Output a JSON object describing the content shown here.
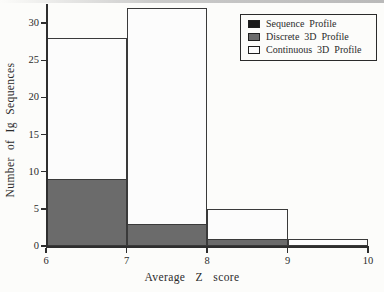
{
  "chart_data": {
    "type": "bar",
    "subtype": "overlaid-histogram",
    "title": "",
    "xlabel": "Average Z score",
    "ylabel": "Number of Ig Sequences",
    "bins": [
      "6-7",
      "7-8",
      "8-9",
      "9-10"
    ],
    "bin_edges": [
      6,
      7,
      8,
      9,
      10
    ],
    "series": [
      {
        "name": "Sequence Profile",
        "color": "#1a1a1a",
        "fill": "black",
        "values": [
          0,
          0,
          0,
          0
        ]
      },
      {
        "name": "Discrete 3D Profile",
        "color": "#6b6b6b",
        "fill": "gray",
        "values": [
          9,
          3,
          1,
          0
        ]
      },
      {
        "name": "Continuous 3D Profile",
        "color": "#fcfcfc",
        "fill": "white",
        "values": [
          28,
          32,
          5,
          1
        ]
      }
    ],
    "x_ticks": [
      6,
      7,
      8,
      9,
      10
    ],
    "y_ticks": [
      0,
      5,
      10,
      15,
      20,
      25,
      30
    ],
    "xlim": [
      6,
      10
    ],
    "ylim": [
      0,
      33
    ],
    "grid": false,
    "legend_position": "top-right"
  },
  "legend": {
    "items": [
      {
        "label": "Sequence Profile"
      },
      {
        "label": "Discrete 3D Profile"
      },
      {
        "label": "Continuous 3D Profile"
      }
    ]
  }
}
